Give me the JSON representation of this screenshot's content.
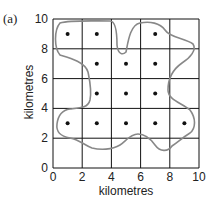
{
  "panel_label": "(a)",
  "x_axis": {
    "label": "kilometres",
    "ticks": [
      "0",
      "2",
      "4",
      "6",
      "8",
      "10"
    ]
  },
  "y_axis": {
    "label": "kilometres",
    "ticks": [
      "0",
      "2",
      "4",
      "6",
      "8",
      "10"
    ]
  },
  "points": [
    [
      1,
      9
    ],
    [
      3,
      9
    ],
    [
      7,
      9
    ],
    [
      3,
      7
    ],
    [
      5,
      7
    ],
    [
      7,
      7
    ],
    [
      3,
      5
    ],
    [
      5,
      5
    ],
    [
      7,
      5
    ],
    [
      1,
      3
    ],
    [
      3,
      3
    ],
    [
      5,
      3
    ],
    [
      7,
      3
    ],
    [
      9,
      3
    ]
  ],
  "colors": {
    "grid": "#111111",
    "outline": "#888888",
    "point": "#111111"
  }
}
